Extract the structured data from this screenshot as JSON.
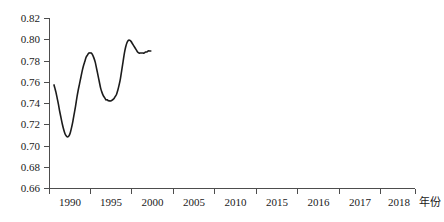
{
  "chart_data": {
    "type": "line",
    "title": "",
    "xlabel": "年份",
    "ylabel": "",
    "ylim": [
      0.66,
      0.82
    ],
    "ytick_step": 0.02,
    "grid": false,
    "legend": "none",
    "line_color": "#1c1c1c",
    "axis_color": "#4d4d4d",
    "categories": [
      "1990",
      "1995",
      "2000",
      "2005",
      "2010",
      "2015",
      "2016",
      "2017",
      "2018"
    ],
    "ytick_labels": [
      "0.66",
      "0.68",
      "0.70",
      "0.72",
      "0.74",
      "0.76",
      "0.78",
      "0.80",
      "0.82"
    ],
    "ytick_values": [
      0.66,
      0.68,
      0.7,
      0.72,
      0.74,
      0.76,
      0.78,
      0.8,
      0.82
    ],
    "x": [
      "1990",
      "1995",
      "2000",
      "2005",
      "2010",
      "2015",
      "2016",
      "2017",
      "2018"
    ],
    "values": [
      0.757,
      0.708,
      0.762,
      0.787,
      0.743,
      0.752,
      0.799,
      0.787,
      0.789
    ],
    "series": [
      {
        "name": "series-1",
        "values": [
          0.757,
          0.708,
          0.762,
          0.787,
          0.743,
          0.752,
          0.799,
          0.787,
          0.789
        ]
      }
    ],
    "dense_points": [
      [
        0.0,
        0.757
      ],
      [
        0.02,
        0.754
      ],
      [
        0.045,
        0.75
      ],
      [
        0.07,
        0.745
      ],
      [
        0.1,
        0.739
      ],
      [
        0.13,
        0.732
      ],
      [
        0.16,
        0.726
      ],
      [
        0.19,
        0.72
      ],
      [
        0.22,
        0.715
      ],
      [
        0.25,
        0.711
      ],
      [
        0.28,
        0.709
      ],
      [
        0.31,
        0.708
      ],
      [
        0.34,
        0.709
      ],
      [
        0.37,
        0.712
      ],
      [
        0.4,
        0.717
      ],
      [
        0.43,
        0.723
      ],
      [
        0.46,
        0.73
      ],
      [
        0.49,
        0.737
      ],
      [
        0.52,
        0.745
      ],
      [
        0.55,
        0.752
      ],
      [
        0.58,
        0.758
      ],
      [
        0.61,
        0.764
      ],
      [
        0.64,
        0.77
      ],
      [
        0.67,
        0.775
      ],
      [
        0.7,
        0.779
      ],
      [
        0.73,
        0.783
      ],
      [
        0.76,
        0.785
      ],
      [
        0.79,
        0.787
      ],
      [
        0.82,
        0.787
      ],
      [
        0.85,
        0.787
      ],
      [
        0.88,
        0.785
      ],
      [
        0.91,
        0.782
      ],
      [
        0.94,
        0.778
      ],
      [
        0.97,
        0.772
      ],
      [
        1.0,
        0.766
      ],
      [
        1.03,
        0.76
      ],
      [
        1.06,
        0.754
      ],
      [
        1.09,
        0.75
      ],
      [
        1.12,
        0.747
      ],
      [
        1.15,
        0.745
      ],
      [
        1.18,
        0.743
      ],
      [
        1.21,
        0.743
      ],
      [
        1.24,
        0.742
      ],
      [
        1.27,
        0.742
      ],
      [
        1.3,
        0.742
      ],
      [
        1.33,
        0.743
      ],
      [
        1.36,
        0.744
      ],
      [
        1.39,
        0.746
      ],
      [
        1.42,
        0.748
      ],
      [
        1.45,
        0.752
      ],
      [
        1.48,
        0.757
      ],
      [
        1.51,
        0.763
      ],
      [
        1.54,
        0.771
      ],
      [
        1.57,
        0.779
      ],
      [
        1.6,
        0.787
      ],
      [
        1.63,
        0.793
      ],
      [
        1.66,
        0.797
      ],
      [
        1.69,
        0.799
      ],
      [
        1.72,
        0.799
      ],
      [
        1.75,
        0.798
      ],
      [
        1.78,
        0.796
      ],
      [
        1.81,
        0.794
      ],
      [
        1.84,
        0.792
      ],
      [
        1.87,
        0.79
      ],
      [
        1.9,
        0.788
      ],
      [
        1.93,
        0.787
      ],
      [
        1.96,
        0.787
      ],
      [
        1.99,
        0.787
      ],
      [
        2.02,
        0.787
      ],
      [
        2.05,
        0.787
      ],
      [
        2.08,
        0.788
      ],
      [
        2.11,
        0.788
      ],
      [
        2.14,
        0.789
      ],
      [
        2.17,
        0.789
      ],
      [
        2.2,
        0.789
      ]
    ],
    "dense_x_scale": {
      "unit_px": 44.0,
      "origin_px": 54.0,
      "note": "dense_points x is in category-index units starting at the 1990 data start"
    },
    "annotations": []
  },
  "axes": {
    "x_axis_name": "x-axis",
    "y_axis_name": "y-axis"
  }
}
